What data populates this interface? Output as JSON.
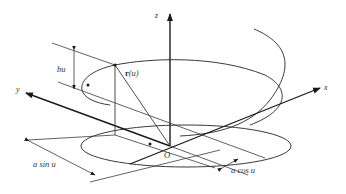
{
  "figure": {
    "axes": {
      "x": "x",
      "y": "y",
      "z": "z",
      "origin": "O"
    },
    "labels": {
      "pitch": "bu",
      "position_vector_bold": "r",
      "position_vector_arg": "(u)",
      "y_component": "a sin u",
      "x_component": "a cos u"
    },
    "colors": {
      "stroke": "#3a3a3a",
      "axis": "#1a1a1a",
      "background": "#ffffff"
    }
  }
}
